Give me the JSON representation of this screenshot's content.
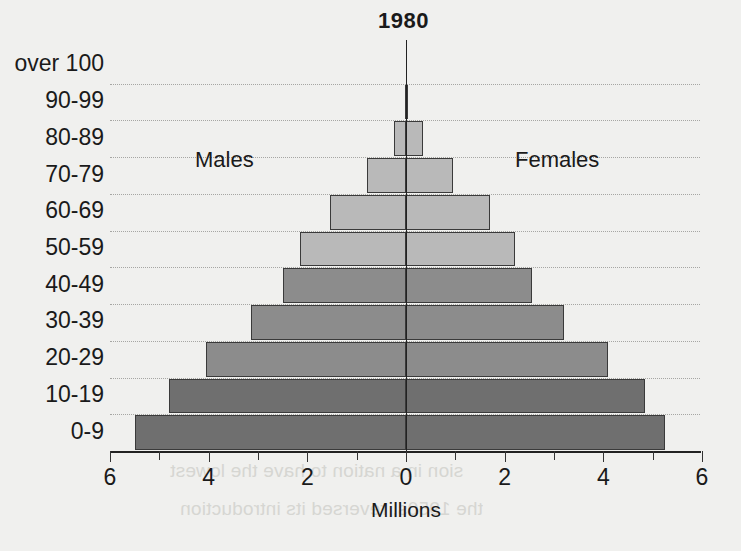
{
  "chart_data": {
    "type": "bar",
    "subtype": "population-pyramid",
    "title": "1980",
    "xlabel": "Millions",
    "ylabel": "",
    "grid": true,
    "xlim": [
      -6,
      6
    ],
    "xticks": [
      6,
      4,
      2,
      0,
      2,
      4,
      6
    ],
    "xtick_minor_step": 1,
    "legend_position": "inline",
    "series_labels": {
      "left": "Males",
      "right": "Females"
    },
    "categories": [
      "over 100",
      "90-99",
      "80-89",
      "70-79",
      "60-69",
      "50-59",
      "40-49",
      "30-39",
      "20-29",
      "10-19",
      "0-9"
    ],
    "series": [
      {
        "name": "Males",
        "side": "left",
        "values": [
          0.0,
          0.02,
          0.25,
          0.8,
          1.55,
          2.15,
          2.5,
          3.15,
          4.05,
          4.8,
          5.5
        ]
      },
      {
        "name": "Females",
        "side": "right",
        "values": [
          0.0,
          0.05,
          0.35,
          0.95,
          1.7,
          2.2,
          2.55,
          3.2,
          4.1,
          4.85,
          5.25
        ]
      }
    ],
    "bar_shades": {
      "light": "#b9b9b9",
      "dark": "#8c8c8c",
      "darker": "#6f6f6f",
      "outline": "#3a3a3a"
    }
  },
  "page": {
    "background_color": "#f0f0ee",
    "ghost_text": [
      "sion in a nation to have the lowest",
      "the 1950s, reversed its introduction"
    ]
  },
  "axis": {
    "tick_labels": [
      "6",
      "4",
      "2",
      "0",
      "2",
      "4",
      "6"
    ],
    "title": "Millions"
  }
}
